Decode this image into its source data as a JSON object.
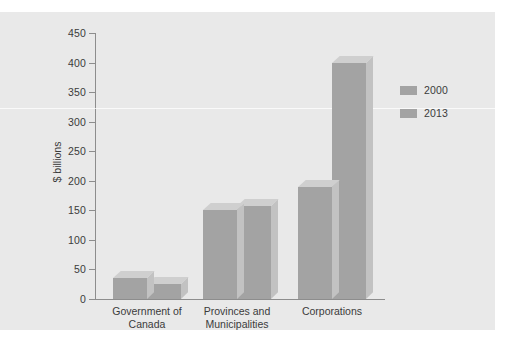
{
  "chart_data": {
    "type": "bar",
    "title": "",
    "xlabel": "",
    "ylabel": "$ billions",
    "ylim": [
      0,
      450
    ],
    "yticks": [
      0,
      50,
      100,
      150,
      200,
      250,
      300,
      350,
      400,
      450
    ],
    "ytick_labels": [
      "0",
      "50",
      "100",
      "150",
      "200",
      "250",
      "300",
      "350",
      "400",
      "450"
    ],
    "grid": false,
    "legend_position": "right",
    "categories": [
      "Government of\nCanada",
      "Provinces and\nMunicipalities",
      "Corporations"
    ],
    "category_lines": [
      [
        "Government of",
        "Canada"
      ],
      [
        "Provinces and",
        "Municipalities"
      ],
      [
        "Corporations"
      ]
    ],
    "series": [
      {
        "name": "2000",
        "color": "#a3a3a3",
        "values": [
          35,
          150,
          190
        ]
      },
      {
        "name": "2013",
        "color": "#a3a3a3",
        "values": [
          25,
          158,
          400
        ]
      }
    ]
  },
  "axis": {
    "y_label": "$ billions"
  },
  "legend": {
    "entries": [
      {
        "label": "2000",
        "color": "#a3a3a3"
      },
      {
        "label": "2013",
        "color": "#a3a3a3"
      }
    ]
  },
  "colors": {
    "page_background": "#ffffff",
    "panel_background": "#e9e9e9",
    "bar_front": "#a3a3a3",
    "bar_top": "#cfcfcf",
    "bar_side": "#c2c2c2",
    "axis": "#8d8d8d",
    "text": "#3b3b3b"
  }
}
